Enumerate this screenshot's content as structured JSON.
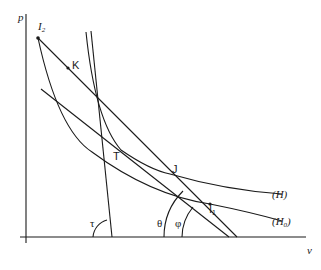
{
  "diagram": {
    "type": "p-v diagram (Hugoniot curves with Rayleigh lines)",
    "axes": {
      "y_label": "p",
      "x_label": "v"
    },
    "points": {
      "I2": {
        "label": "I",
        "sub": "2"
      },
      "K": {
        "label": "K"
      },
      "T": {
        "label": "T"
      },
      "J": {
        "label": "J"
      },
      "I1": {
        "label": "I",
        "sub": "1"
      }
    },
    "curves": {
      "H": {
        "label": "(H)"
      },
      "H0": {
        "label": "(H",
        "sub": "0",
        "close": ")"
      }
    },
    "angles": {
      "tau": "τ",
      "theta": "θ",
      "phi": "φ"
    },
    "colors": {
      "ink": "#1a1a1a",
      "background": "#ffffff"
    }
  }
}
